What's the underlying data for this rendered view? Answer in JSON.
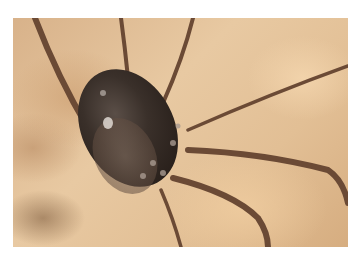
{
  "image": {
    "subject": "harvestman (daddy longlegs) close-up",
    "alt": "Close-up of a dark, bumpy-bodied harvestman with long thin brown legs against a blurred sandy beige background",
    "colors": {
      "background": "#e2bf95",
      "body": "#3a302a",
      "legs": "#6b4a35",
      "border": "#ffffff"
    }
  }
}
